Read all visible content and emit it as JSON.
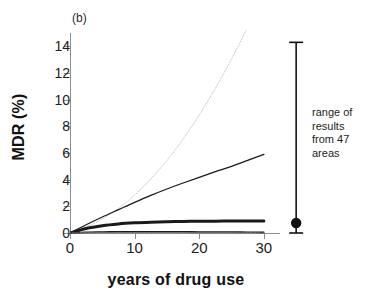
{
  "figure": {
    "panel_label": "(b)"
  },
  "chart_data": {
    "type": "line",
    "title": "",
    "panel": "(b)",
    "xlabel": "years of drug use",
    "ylabel": "MDR (%)",
    "xlim": [
      0,
      32.5
    ],
    "ylim": [
      0,
      15
    ],
    "xticks": [
      0,
      10,
      20,
      30
    ],
    "yticks": [
      0,
      2,
      4,
      6,
      8,
      10,
      12,
      14
    ],
    "xtick_labels": [
      "0",
      "10",
      "20",
      "30"
    ],
    "ytick_labels": [
      "0",
      "2",
      "4",
      "6",
      "8",
      "10",
      "12",
      "14"
    ],
    "grid": false,
    "legend": "none",
    "x": [
      0,
      2.5,
      5,
      7.5,
      10,
      12.5,
      15,
      17.5,
      20,
      22.5,
      25,
      27.5,
      30
    ],
    "series": [
      {
        "name": "upper-scenario",
        "style": "dotted",
        "color": "#c9c9c9",
        "width": 1,
        "clipped_above_axis": true,
        "exits_top_at_x": 22.0,
        "values": [
          0,
          0.45,
          1.05,
          1.85,
          2.85,
          4.05,
          5.45,
          7.05,
          8.85,
          10.85,
          13.05,
          15.45,
          18.05
        ]
      },
      {
        "name": "high-scenario",
        "style": "solid",
        "color": "#1a1a1a",
        "width": 1.3,
        "values": [
          0,
          0.62,
          1.2,
          1.75,
          2.3,
          2.82,
          3.3,
          3.75,
          4.18,
          4.6,
          5.0,
          5.45,
          5.9
        ]
      },
      {
        "name": "mid-scenario",
        "style": "solid",
        "color": "#1a1a1a",
        "width": 3,
        "values": [
          0,
          0.34,
          0.55,
          0.68,
          0.76,
          0.81,
          0.845,
          0.865,
          0.88,
          0.89,
          0.895,
          0.9,
          0.9
        ]
      },
      {
        "name": "low-scenario",
        "style": "solid",
        "color": "#1a1a1a",
        "width": 1.6,
        "values": [
          0,
          0.06,
          0.08,
          0.09,
          0.09,
          0.09,
          0.09,
          0.09,
          0.08,
          0.08,
          0.07,
          0.06,
          0.05
        ]
      },
      {
        "name": "near-zero-scenario",
        "style": "dotted",
        "color": "#6e6e6e",
        "width": 1.4,
        "values": [
          0,
          0.02,
          0.03,
          0.03,
          0.03,
          0.03,
          0.03,
          0.03,
          0.02,
          0.02,
          0.02,
          0.02,
          0.01
        ]
      }
    ],
    "error_bar": {
      "name": "range of results from 47 areas",
      "x": 35,
      "point": 0.75,
      "upper": 14.3,
      "lower": 0.0,
      "marker": "filled-circle",
      "color": "#111111"
    },
    "annotation": {
      "lines": [
        "range of",
        "results",
        "from 47",
        "areas"
      ]
    }
  }
}
